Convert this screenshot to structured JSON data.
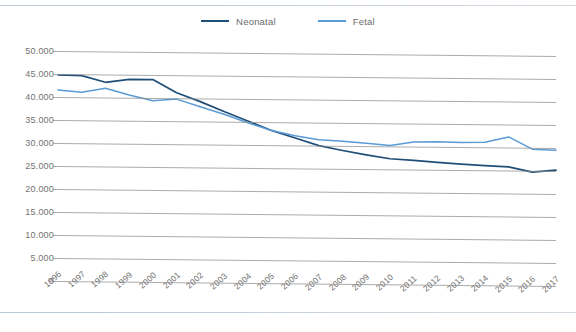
{
  "chart_data": {
    "type": "line",
    "title": "",
    "xlabel": "",
    "ylabel": "",
    "ylim": [
      0,
      50000
    ],
    "ytick_labels": [
      "50.000",
      "45.000",
      "40.000",
      "35.000",
      "30.000",
      "25.000",
      "20.000",
      "15.000",
      "10.000",
      "5.000",
      "0"
    ],
    "ytick_values": [
      50000,
      45000,
      40000,
      35000,
      30000,
      25000,
      20000,
      15000,
      10000,
      5000,
      0
    ],
    "grid": "horizontal",
    "legend_position": "top-center",
    "categories": [
      "1996",
      "1997",
      "1998",
      "1999",
      "2000",
      "2001",
      "2002",
      "2003",
      "2004",
      "2005",
      "2006",
      "2007",
      "2008",
      "2009",
      "2010",
      "2011",
      "2012",
      "2013",
      "2014",
      "2015",
      "2016",
      "2017"
    ],
    "series": [
      {
        "name": "Neonatal",
        "color": "#1F4E79",
        "values": [
          44800,
          44700,
          43300,
          44000,
          44000,
          41200,
          39300,
          37200,
          35200,
          33200,
          31600,
          30000,
          29000,
          28100,
          27300,
          27000,
          26600,
          26300,
          26000,
          25800,
          24700,
          25200
        ]
      },
      {
        "name": "Fetal",
        "color": "#5B9BD5",
        "values": [
          41500,
          41100,
          42000,
          40600,
          39400,
          39800,
          38200,
          36600,
          34800,
          33200,
          32100,
          31300,
          31000,
          30600,
          30200,
          31000,
          31100,
          31000,
          31100,
          32300,
          29700,
          29500
        ]
      }
    ]
  },
  "legend": {
    "items": [
      {
        "label": "Neonatal",
        "color": "#1F4E79",
        "icon": "line-swatch-icon"
      },
      {
        "label": "Fetal",
        "color": "#5B9BD5",
        "icon": "line-swatch-icon"
      }
    ]
  }
}
